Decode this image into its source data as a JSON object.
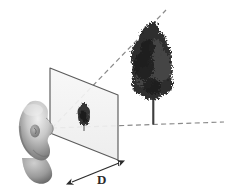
{
  "figure": {
    "background_color": "#ffffff",
    "width": 227,
    "height": 196
  },
  "labels": {
    "distance_label": "D",
    "distance_label_meaning": "distance from eye to image plane"
  },
  "elements": {
    "observer": {
      "name": "head",
      "description": "grayscale 3D rendered bald human head in profile facing right",
      "color_light": "#e6e6e6",
      "color_mid": "#9a9a9a",
      "color_dark": "#5a5a5a",
      "eye_point": {
        "x": 52,
        "y": 128
      }
    },
    "image_plane": {
      "name": "projection-plane",
      "description": "transparent parallelogram image plane",
      "fill": "#f2f2f2",
      "stroke": "#555555",
      "corners": [
        {
          "x": 50,
          "y": 68
        },
        {
          "x": 118,
          "y": 95
        },
        {
          "x": 118,
          "y": 160
        },
        {
          "x": 50,
          "y": 133
        }
      ]
    },
    "projected_tree": {
      "name": "small-tree-on-plane",
      "description": "small dark projected image of the tree on the plane",
      "color": "#3a3a3a",
      "base": {
        "x": 84,
        "y": 131
      },
      "height": 24
    },
    "real_tree": {
      "name": "large-tree",
      "description": "dark textured deciduous tree in the scene",
      "color": "#2e2e2e",
      "trunk_color": "#4a4a4a",
      "base": {
        "x": 153,
        "y": 124
      },
      "height": 96
    },
    "sight_line_top": {
      "name": "upper-projection-ray",
      "description": "dashed ray from eye through top of plane to top of tree",
      "style": "dashed",
      "color": "#808080",
      "from": {
        "x": 52,
        "y": 128
      },
      "to": {
        "x": 166,
        "y": 10
      }
    },
    "sight_line_bottom": {
      "name": "lower-projection-ray",
      "description": "dashed ray from eye along ground through tree base",
      "style": "dashed",
      "color": "#808080",
      "from": {
        "x": 52,
        "y": 128
      },
      "to": {
        "x": 224,
        "y": 122
      }
    },
    "dimension": {
      "name": "distance-dimension",
      "description": "double headed arrow measuring distance D from eye to plane",
      "color": "#2b2b2b",
      "from": {
        "x": 72,
        "y": 182
      },
      "to": {
        "x": 119,
        "y": 163
      },
      "label_position": {
        "x": 101,
        "y": 182
      }
    },
    "leader_line": {
      "name": "plane-leader-line",
      "description": "vertical leader from plane bottom-right corner down to dimension arrow",
      "color": "#555555"
    }
  }
}
